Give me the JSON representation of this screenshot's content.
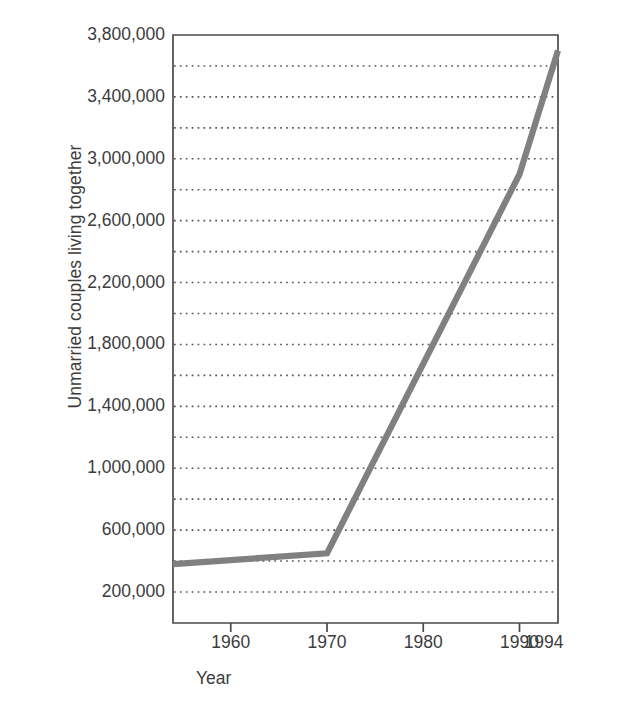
{
  "chart_data": {
    "type": "line",
    "title": "",
    "xlabel": "Year",
    "ylabel": "Unmarried couples living together",
    "xlim": [
      1954,
      1994
    ],
    "ylim": [
      100000,
      3800000
    ],
    "grid": "horizontal-dotted",
    "legend": "none",
    "line_color": "#808080",
    "x_ticks": [
      {
        "value": 1960,
        "label": "1960"
      },
      {
        "value": 1970,
        "label": "1970"
      },
      {
        "value": 1980,
        "label": "1980"
      },
      {
        "value": 1990,
        "label": "1990"
      },
      {
        "value": 1994,
        "label": "1994"
      }
    ],
    "y_ticks": [
      {
        "value": 3800000,
        "label": "3,800,000"
      },
      {
        "value": 3400000,
        "label": "3,400,000"
      },
      {
        "value": 3000000,
        "label": "3,000,000"
      },
      {
        "value": 2600000,
        "label": "2,600,000"
      },
      {
        "value": 2200000,
        "label": "2,200,000"
      },
      {
        "value": 1800000,
        "label": "1,800,000"
      },
      {
        "value": 1400000,
        "label": "1,400,000"
      },
      {
        "value": 1000000,
        "label": "1,000,000"
      },
      {
        "value": 600000,
        "label": "600,000"
      },
      {
        "value": 200000,
        "label": "200,000"
      }
    ],
    "gridlines": [
      3600000,
      3400000,
      3200000,
      3000000,
      2800000,
      2600000,
      2400000,
      2200000,
      2000000,
      1800000,
      1600000,
      1400000,
      1200000,
      1000000,
      800000,
      600000,
      400000,
      200000
    ],
    "x": [
      1954,
      1970,
      1990,
      1994
    ],
    "values": [
      380000,
      450000,
      2900000,
      3700000
    ],
    "series": [
      {
        "name": "Unmarried couples living together",
        "x": [
          1954,
          1970,
          1990,
          1994
        ],
        "values": [
          380000,
          450000,
          2900000,
          3700000
        ]
      }
    ]
  },
  "axis_titles": {
    "y": "Unmarried couples living together",
    "x": "Year"
  }
}
